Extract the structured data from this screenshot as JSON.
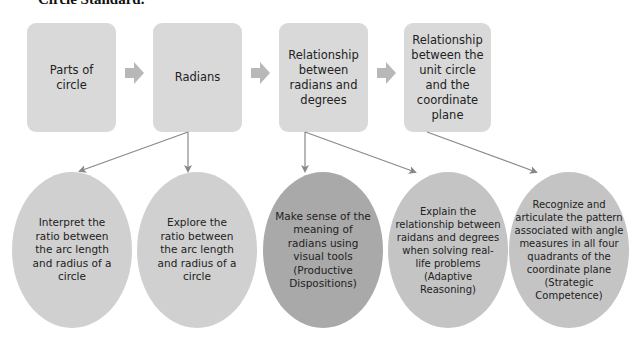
{
  "title": "Circle Standard.",
  "boxes": [
    {
      "label": "Parts of circle"
    },
    {
      "label": "Radians"
    },
    {
      "label": "Relationship between radians and degrees"
    },
    {
      "label": "Relationship between the unit circle and the coordinate plane"
    }
  ],
  "ellipses": [
    {
      "label": "Interpret the ratio between the arc length and radius of a circle"
    },
    {
      "label": "Explore the ratio between the arc length and radius of a circle"
    },
    {
      "label": "Make sense of the meaning of radians using visual tools (Productive Dispositions)"
    },
    {
      "label": "Explain the relationship between raidans and degrees when solving real-life problems (Adaptive Reasoning)"
    },
    {
      "label": "Recognize and articulate the pattern associated with angle measures in all four quadrants of the coordinate plane (Strategic Competence)"
    }
  ],
  "colors": {
    "box": "#d9d9d9",
    "ellipse": "#d0d0d0",
    "ellipse_dark": "#a9a9a9",
    "arrow": "#b8b8b8",
    "connector": "#888888"
  }
}
